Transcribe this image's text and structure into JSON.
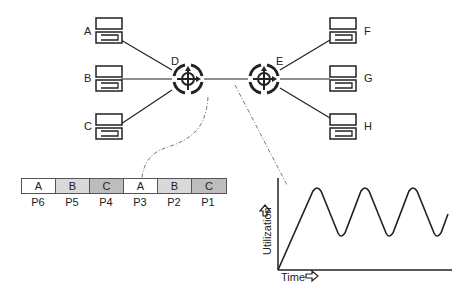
{
  "diagram": {
    "hosts_left": [
      {
        "id": "A",
        "label": "A"
      },
      {
        "id": "B",
        "label": "B"
      },
      {
        "id": "C",
        "label": "C"
      }
    ],
    "hosts_right": [
      {
        "id": "F",
        "label": "F"
      },
      {
        "id": "G",
        "label": "G"
      },
      {
        "id": "H",
        "label": "H"
      }
    ],
    "routers": [
      {
        "id": "D",
        "label": "D"
      },
      {
        "id": "E",
        "label": "E"
      }
    ],
    "packet_queue": {
      "packets": [
        {
          "content": "A",
          "name": "P6",
          "color": "#ffffff"
        },
        {
          "content": "B",
          "name": "P5",
          "color": "#d9d9d9"
        },
        {
          "content": "C",
          "name": "P4",
          "color": "#bdbdbd"
        },
        {
          "content": "A",
          "name": "P3",
          "color": "#ffffff"
        },
        {
          "content": "B",
          "name": "P2",
          "color": "#d9d9d9"
        },
        {
          "content": "C",
          "name": "P1",
          "color": "#bdbdbd"
        }
      ]
    },
    "utilization_graph": {
      "ylabel": "Utilization",
      "xlabel": "Time"
    }
  }
}
